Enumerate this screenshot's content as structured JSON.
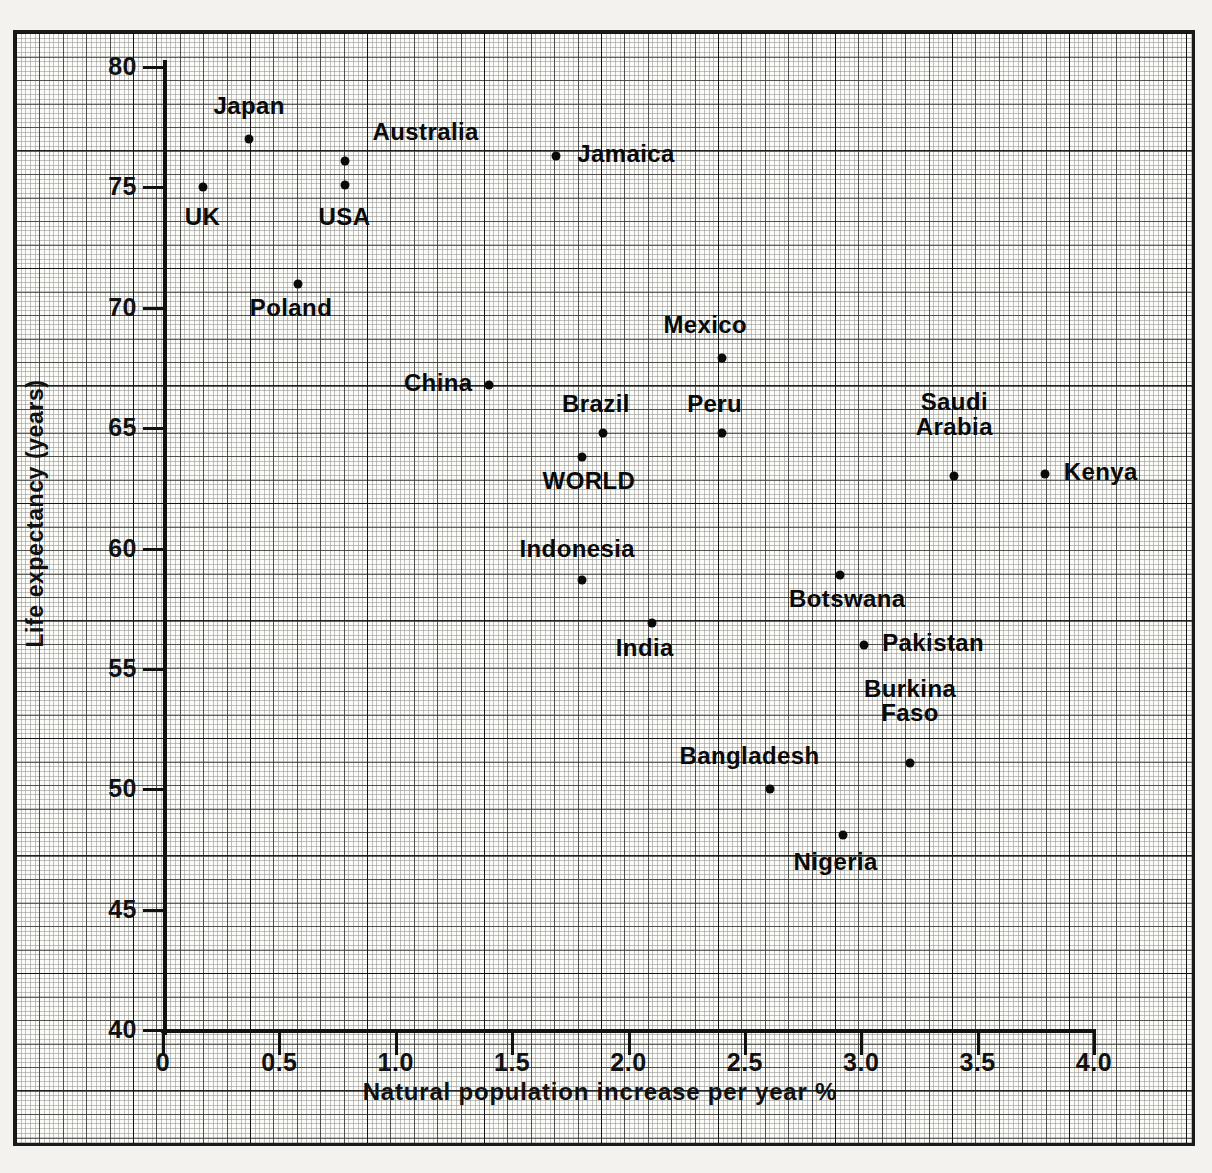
{
  "chart_data": {
    "type": "scatter",
    "title": "",
    "xlabel": "Natural population increase per year %",
    "ylabel": "Life expectancy (years)",
    "xlim": [
      0,
      4.0
    ],
    "ylim": [
      40,
      80
    ],
    "xticks": [
      "0",
      "0.5",
      "1.0",
      "1.5",
      "2.0",
      "2.5",
      "3.0",
      "3.5",
      "4.0"
    ],
    "xtick_values": [
      0,
      0.5,
      1.0,
      1.5,
      2.0,
      2.5,
      3.0,
      3.5,
      4.0
    ],
    "yticks": [
      "80",
      "75",
      "70",
      "65",
      "60",
      "55",
      "50",
      "45",
      "40"
    ],
    "ytick_values": [
      80,
      75,
      70,
      65,
      60,
      55,
      50,
      45,
      40
    ],
    "grid": true,
    "grid_style": "graph-paper",
    "legend": "none",
    "points": [
      {
        "label": "Japan",
        "x": 0.37,
        "y": 77.0,
        "lx": 0.37,
        "ly": 78.3,
        "align": "c"
      },
      {
        "label": "UK",
        "x": 0.17,
        "y": 75.0,
        "lx": 0.17,
        "ly": 73.7,
        "align": "c"
      },
      {
        "label": "Australia",
        "x": 0.78,
        "y": 76.1,
        "lx": 0.9,
        "ly": 77.2,
        "align": "l"
      },
      {
        "label": "USA",
        "x": 0.78,
        "y": 75.1,
        "lx": 0.78,
        "ly": 73.7,
        "align": "c"
      },
      {
        "label": "Jamaica",
        "x": 1.69,
        "y": 76.3,
        "lx": 1.78,
        "ly": 76.3,
        "align": "l"
      },
      {
        "label": "Poland",
        "x": 0.58,
        "y": 71.0,
        "lx": 0.55,
        "ly": 69.9,
        "align": "c"
      },
      {
        "label": "Mexico",
        "x": 2.4,
        "y": 67.9,
        "lx": 2.33,
        "ly": 69.2,
        "align": "c"
      },
      {
        "label": "China",
        "x": 1.4,
        "y": 66.8,
        "lx": 1.33,
        "ly": 66.8,
        "align": "r"
      },
      {
        "label": "Brazil",
        "x": 1.89,
        "y": 64.8,
        "lx": 1.86,
        "ly": 65.9,
        "align": "c"
      },
      {
        "label": "Peru",
        "x": 2.4,
        "y": 64.8,
        "lx": 2.37,
        "ly": 65.9,
        "align": "c"
      },
      {
        "label": "WORLD",
        "x": 1.8,
        "y": 63.8,
        "lx": 1.83,
        "ly": 62.7,
        "align": "c"
      },
      {
        "label": "Saudi\nArabia",
        "x": 3.4,
        "y": 63.0,
        "lx": 3.4,
        "ly": 65.4,
        "align": "c"
      },
      {
        "label": "Kenya",
        "x": 3.79,
        "y": 63.1,
        "lx": 3.87,
        "ly": 63.1,
        "align": "l"
      },
      {
        "label": "Indonesia",
        "x": 1.8,
        "y": 58.7,
        "lx": 1.78,
        "ly": 59.9,
        "align": "c"
      },
      {
        "label": "Botswana",
        "x": 2.91,
        "y": 58.9,
        "lx": 2.94,
        "ly": 57.8,
        "align": "c"
      },
      {
        "label": "India",
        "x": 2.1,
        "y": 56.9,
        "lx": 2.07,
        "ly": 55.8,
        "align": "c"
      },
      {
        "label": "Pakistan",
        "x": 3.01,
        "y": 56.0,
        "lx": 3.09,
        "ly": 56.0,
        "align": "l"
      },
      {
        "label": "Burkina\nFaso",
        "x": 3.21,
        "y": 51.1,
        "lx": 3.21,
        "ly": 53.5,
        "align": "c"
      },
      {
        "label": "Bangladesh",
        "x": 2.61,
        "y": 50.0,
        "lx": 2.52,
        "ly": 51.3,
        "align": "c"
      },
      {
        "label": "Nigeria",
        "x": 2.92,
        "y": 48.1,
        "lx": 2.89,
        "ly": 46.9,
        "align": "c"
      }
    ]
  },
  "axes": {
    "x_title": "Natural population increase per year %",
    "y_title": "Life expectancy (years)"
  },
  "colors": {
    "ink": "#0a0a0a",
    "paper": "#fbfbf8",
    "grid": "#282828",
    "page": "#f3f2ef"
  }
}
